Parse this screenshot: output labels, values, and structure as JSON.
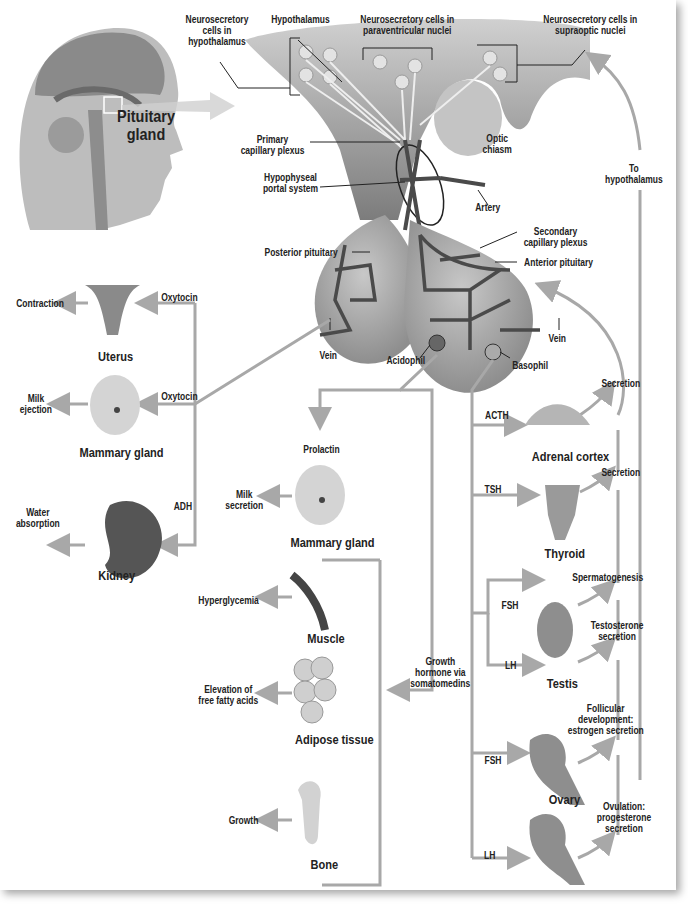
{
  "colors": {
    "arrow": "#a8a8a8",
    "tissue": "#9a9a9a",
    "vessel": "#4a4a4a",
    "text": "#222222"
  },
  "head": {
    "label": "Pituitary\ngland"
  },
  "hypothalamus": {
    "label": "Hypothalamus",
    "neurosecretory_hypothalamus": "Neurosecretory\ncells in\nhypothalamus",
    "neurosecretory_paraventricular": "Neurosecretory cells in\nparaventricular nuclei",
    "neurosecretory_supraoptic": "Neurosecretory cells in\nsupraoptic nuclei",
    "primary_capillary_plexus": "Primary\ncapillary plexus",
    "hypophyseal_portal_system": "Hypophyseal\nportal system",
    "optic_chiasm": "Optic\nchiasm",
    "artery": "Artery",
    "to_hypothalamus": "To\nhypothalamus"
  },
  "pituitary": {
    "posterior": "Posterior pituitary",
    "anterior": "Anterior pituitary",
    "secondary_capillary_plexus": "Secondary\ncapillary plexus",
    "vein_left": "Vein",
    "vein_right": "Vein",
    "acidophil": "Acidophil",
    "basophil": "Basophil"
  },
  "posterior_targets": [
    {
      "organ": "Uterus",
      "hormone": "Oxytocin",
      "effect": "Contraction"
    },
    {
      "organ": "Mammary gland",
      "hormone": "Oxytocin",
      "effect": "Milk\nejection"
    },
    {
      "organ": "Kidney",
      "hormone": "ADH",
      "effect": "Water\nabsorption"
    }
  ],
  "acidophil_targets": {
    "prolactin": {
      "hormone": "Prolactin",
      "organ": "Mammary gland",
      "effect": "Milk\nsecretion"
    },
    "growth_hormone": {
      "hormone": "Growth\nhormone via\nsomatomedins",
      "targets": [
        {
          "organ": "Muscle",
          "effect": "Hyperglycemia"
        },
        {
          "organ": "Adipose tissue",
          "effect": "Elevation of\nfree fatty acids"
        },
        {
          "organ": "Bone",
          "effect": "Growth"
        }
      ]
    }
  },
  "basophil_targets": [
    {
      "organ": "Adrenal cortex",
      "hormone": "ACTH",
      "effect": "Secretion"
    },
    {
      "organ": "Thyroid",
      "hormone": "TSH",
      "effect": "Secretion"
    },
    {
      "organ": "Testis",
      "hormones": [
        "FSH",
        "LH"
      ],
      "effects": [
        "Spermatogenesis",
        "Testosterone\nsecretion"
      ]
    },
    {
      "organ": "Ovary",
      "hormones": [
        "FSH",
        "LH"
      ],
      "effects": [
        "Follicular\ndevelopment:\nestrogen secretion",
        "Ovulation:\nprogesterone\nsecretion"
      ]
    }
  ]
}
